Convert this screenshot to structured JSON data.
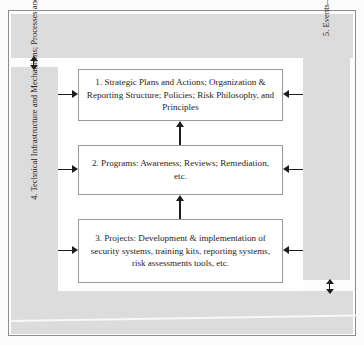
{
  "diagram": {
    "type": "process-flow",
    "boxes": [
      {
        "id": "box-1",
        "number": "1.",
        "text": "1. Strategic Plans and Actions; Organization & Reporting Structure; Policies; Risk Philosophy, and Principles"
      },
      {
        "id": "box-2",
        "number": "2.",
        "text": "2. Programs: Awareness; Reviews; Remediation, etc."
      },
      {
        "id": "box-3",
        "number": "3.",
        "text": "3. Projects: Development & implementation of security systems, training kits, reporting systems, risk assessments tools, etc."
      }
    ],
    "bands": {
      "left": {
        "number": "4.",
        "text": "4. Technical Infrastructure and Mechanisms; Processes and Methodology for fulfilling strategy, programs and projects"
      },
      "right": {
        "number": "5.",
        "text": "5. Events–Planned and Unplanned–Handling and Management"
      },
      "top": {
        "text": ""
      },
      "bottom": {
        "text": ""
      }
    },
    "colors": {
      "band_fill": "#dcdcdc",
      "box_fill": "#ffffff",
      "box_border": "#9a9a9a",
      "frame_border": "#8d8d8d",
      "arrow": "#1d1d1d",
      "text": "#2a2220",
      "page_background": "#fbfbfb"
    }
  }
}
